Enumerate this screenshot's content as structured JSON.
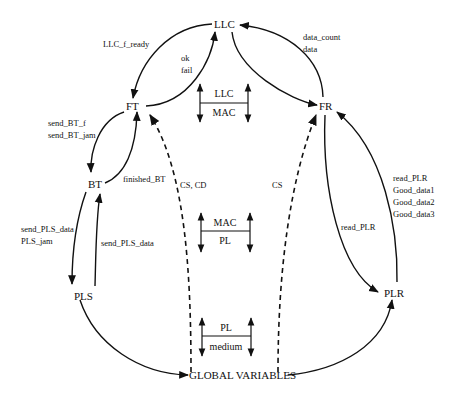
{
  "nodes": {
    "llc": "LLC",
    "ft": "FT",
    "fr": "FR",
    "bt": "BT",
    "pls": "PLS",
    "plr": "PLR",
    "global": "GLOBAL VARIABLES"
  },
  "edge_labels": {
    "llc_to_ft": "LLC_f_ready",
    "ft_to_llc_1": "ok",
    "ft_to_llc_2": "fail",
    "fr_to_llc_1": "data_count",
    "fr_to_llc_2": "data",
    "ft_to_bt_1": "send_BT_f",
    "ft_to_bt_2": "send_BT_jam",
    "bt_to_ft": "finished_BT",
    "bt_to_pls_1": "send_PLS_data",
    "bt_to_pls_2": "PLS_jam",
    "pls_to_bt": "send_PLS_data",
    "global_to_ft": "CS, CD",
    "global_to_fr": "CS",
    "fr_to_plr": "read_PLR",
    "plr_to_fr_1": "read_PLR",
    "plr_to_fr_2": "Good_data1",
    "plr_to_fr_3": "Good_data2",
    "plr_to_fr_4": "Good_data3"
  },
  "layers": [
    {
      "upper": "LLC",
      "lower": "MAC"
    },
    {
      "upper": "MAC",
      "lower": "PL"
    },
    {
      "upper": "PL",
      "lower": "medium"
    }
  ]
}
